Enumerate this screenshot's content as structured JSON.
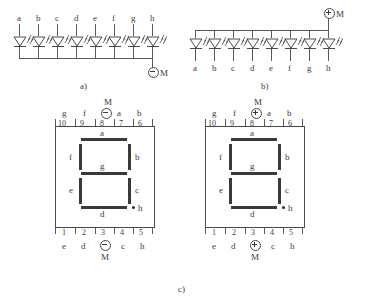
{
  "figure": {
    "captions": {
      "a": "a)",
      "b": "b)",
      "c": "c)"
    }
  },
  "diagram_a": {
    "name": "common-cathode-led-array",
    "pin_labels": [
      "a",
      "b",
      "c",
      "d",
      "e",
      "f",
      "g",
      "h"
    ],
    "terminal": {
      "label": "M",
      "polarity": "minus",
      "symbol": "⊖"
    },
    "led_count": 8,
    "icon": "led-diode-icon"
  },
  "diagram_b": {
    "name": "common-anode-led-array",
    "pin_labels": [
      "a",
      "b",
      "c",
      "d",
      "e",
      "f",
      "g",
      "h"
    ],
    "terminal": {
      "label": "M",
      "polarity": "plus",
      "symbol": "⊕"
    },
    "led_count": 8,
    "icon": "led-diode-icon"
  },
  "diagram_c": {
    "displays": [
      {
        "name": "seven-segment-common-cathode",
        "top_pin_numbers": [
          "10",
          "9",
          "8",
          "7",
          "6"
        ],
        "top_pin_labels": [
          "g",
          "f",
          "M",
          "a",
          "b"
        ],
        "top_terminal": {
          "label": "M",
          "polarity": "minus",
          "symbol": "⊖"
        },
        "bottom_pin_numbers": [
          "1",
          "2",
          "3",
          "4",
          "5"
        ],
        "bottom_pin_labels": [
          "e",
          "d",
          "M",
          "c",
          "h"
        ],
        "bottom_terminal": {
          "label": "M",
          "polarity": "minus",
          "symbol": "⊖"
        },
        "segments": [
          "a",
          "b",
          "c",
          "d",
          "e",
          "f",
          "g"
        ],
        "decimal_point": "h"
      },
      {
        "name": "seven-segment-common-anode",
        "top_pin_numbers": [
          "10",
          "9",
          "8",
          "7",
          "6"
        ],
        "top_pin_labels": [
          "g",
          "f",
          "M",
          "a",
          "b"
        ],
        "top_terminal": {
          "label": "M",
          "polarity": "plus",
          "symbol": "⊕"
        },
        "bottom_pin_numbers": [
          "1",
          "2",
          "3",
          "4",
          "5"
        ],
        "bottom_pin_labels": [
          "e",
          "d",
          "M",
          "c",
          "h"
        ],
        "bottom_terminal": {
          "label": "M",
          "polarity": "plus",
          "symbol": "⊕"
        },
        "segments": [
          "a",
          "b",
          "c",
          "d",
          "e",
          "f",
          "g"
        ],
        "decimal_point": "h"
      }
    ],
    "segment_names": {
      "a": "a",
      "b": "b",
      "c": "c",
      "d": "d",
      "e": "e",
      "f": "f",
      "g": "g",
      "h": "h"
    }
  },
  "colors": {
    "line": "#5a5a5a",
    "segment": "#3a3a3a",
    "text": "#3a3a3a",
    "background": "#ffffff"
  }
}
